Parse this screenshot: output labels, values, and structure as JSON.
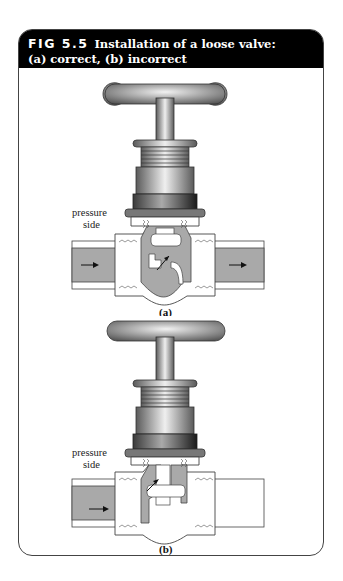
{
  "figure": {
    "number": "FIG 5.5",
    "title_line1": "Installation of a loose valve:",
    "title_line2": "(a) correct, (b) incorrect",
    "colors": {
      "header_bg": "#000000",
      "header_text": "#ffffff",
      "fluid": "#a9a9a9",
      "metal_dark": "#555555",
      "metal_light": "#e6e6e6"
    },
    "panels": [
      {
        "id": "a",
        "caption": "(a)",
        "side_label_1": "pressure",
        "side_label_2": "side",
        "flow_arrows": [
          "arrow-right",
          "arrow-right"
        ],
        "state": "correct"
      },
      {
        "id": "b",
        "caption": "(b)",
        "side_label_1": "pressure",
        "side_label_2": "side",
        "flow_arrows": [
          "arrow-right"
        ],
        "state": "incorrect"
      }
    ]
  }
}
